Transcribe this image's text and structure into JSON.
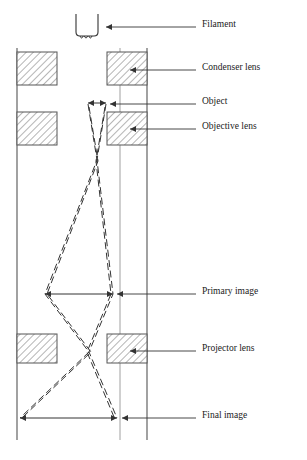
{
  "diagram": {
    "colors": {
      "line": "#333333",
      "hatch": "#666666",
      "text": "#1a1a1a",
      "background": "#ffffff"
    },
    "labels": [
      {
        "id": "filament",
        "text": "Filament",
        "x": 202,
        "y": 26,
        "leader_x1": 196,
        "leader_x2": 106,
        "leader_y": 27,
        "arrow": true
      },
      {
        "id": "condenser-lens",
        "text": "Condenser lens",
        "x": 202,
        "y": 69,
        "leader_x1": 196,
        "leader_x2": 114,
        "leader_y": 70,
        "arrow": true
      },
      {
        "id": "object",
        "text": "Object",
        "x": 202,
        "y": 103,
        "leader_x1": 196,
        "leader_x2": 108,
        "leader_y": 104,
        "arrow": true
      },
      {
        "id": "objective-lens",
        "text": "Objective lens",
        "x": 202,
        "y": 128,
        "leader_x1": 196,
        "leader_x2": 114,
        "leader_y": 129,
        "arrow": true
      },
      {
        "id": "primary-image",
        "text": "Primary image",
        "x": 202,
        "y": 293,
        "leader_x1": 196,
        "leader_x2": 114,
        "leader_y": 294,
        "arrow": true
      },
      {
        "id": "projector-lens",
        "text": "Projector lens",
        "x": 202,
        "y": 350,
        "leader_x1": 196,
        "leader_x2": 114,
        "leader_y": 351,
        "arrow": true
      },
      {
        "id": "final-image",
        "text": "Final image",
        "x": 202,
        "y": 417,
        "leader_x1": 196,
        "leader_x2": 118,
        "leader_y": 418,
        "arrow": true
      }
    ],
    "column": {
      "left_wall_x": 17,
      "right_wall_x": 147,
      "top_y": 48,
      "bottom_y": 440
    },
    "optical_axis": {
      "x": 120,
      "top_y": 48,
      "bottom_y": 440
    },
    "filament": {
      "left_x": 76,
      "right_x": 98,
      "top_y": 14,
      "bottom_y": 36,
      "coil_count": 3
    },
    "lenses": [
      {
        "id": "condenser-left",
        "x": 17,
        "y": 52,
        "w": 40,
        "h": 33
      },
      {
        "id": "condenser-right",
        "x": 107,
        "y": 52,
        "w": 40,
        "h": 33
      },
      {
        "id": "objective-left",
        "x": 17,
        "y": 112,
        "w": 40,
        "h": 33
      },
      {
        "id": "objective-right",
        "x": 107,
        "y": 112,
        "w": 40,
        "h": 33
      },
      {
        "id": "projector-left",
        "x": 17,
        "y": 334,
        "w": 40,
        "h": 29
      },
      {
        "id": "projector-right",
        "x": 107,
        "y": 334,
        "w": 40,
        "h": 29
      }
    ],
    "image_planes": [
      {
        "id": "object-plane",
        "x1": 88,
        "x2": 106,
        "y": 103,
        "double_arrow": true
      },
      {
        "id": "primary-image-plane",
        "x1": 45,
        "x2": 113,
        "y": 294,
        "double_arrow": true
      },
      {
        "id": "final-image-plane",
        "x1": 20,
        "x2": 117,
        "y": 418,
        "double_arrow": true
      }
    ],
    "ray_crossovers": [
      {
        "id": "objective-crossover",
        "x": 97,
        "y": 160
      },
      {
        "id": "projector-crossover",
        "x": 89,
        "y": 352
      }
    ]
  }
}
